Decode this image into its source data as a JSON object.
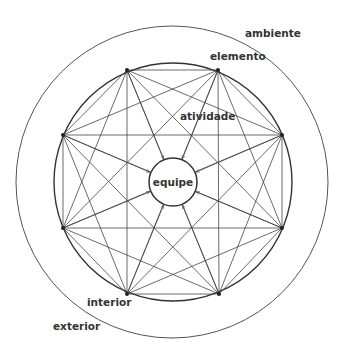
{
  "diagram": {
    "labels": {
      "ambiente": "ambiente",
      "elemento": "elemento",
      "atividade": "atividade",
      "equipe": "equipe",
      "interior": "interior",
      "exterior": "exterior"
    },
    "circles": {
      "outer": {
        "cx": 172,
        "cy": 182,
        "r": 156
      },
      "inner": {
        "cx": 173,
        "cy": 182,
        "r": 119
      },
      "center": {
        "cx": 173,
        "cy": 182,
        "r": 24
      }
    },
    "vertices": [
      [
        127,
        70
      ],
      [
        218,
        70
      ],
      [
        282,
        135
      ],
      [
        282,
        228
      ],
      [
        219,
        294
      ],
      [
        127,
        294
      ],
      [
        63,
        228
      ],
      [
        63,
        135
      ]
    ],
    "colors": {
      "line": "#444444",
      "text": "#333333"
    }
  }
}
